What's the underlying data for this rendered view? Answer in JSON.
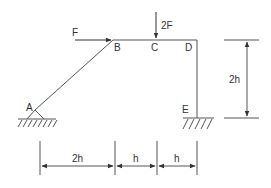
{
  "diagram": {
    "type": "structural-frame",
    "stroke_color": "#555555",
    "nodes": {
      "A": "A",
      "B": "B",
      "C": "C",
      "D": "D",
      "E": "E"
    },
    "loads": {
      "horizontal": "F",
      "vertical": "2F"
    },
    "dimensions": {
      "height": "2h",
      "span_ab": "2h",
      "span_bc": "h",
      "span_cd": "h"
    },
    "supports": {
      "A": "pinned",
      "E": "fixed"
    }
  }
}
